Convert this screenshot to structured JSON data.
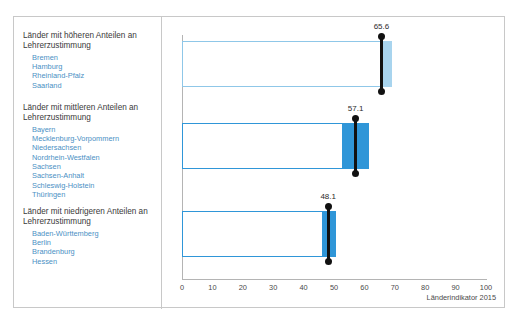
{
  "top_caption": "",
  "footer": {
    "source": "Länderindikator 2015"
  },
  "axis": {
    "ticks": [
      "0",
      "10",
      "20",
      "30",
      "40",
      "50",
      "60",
      "70",
      "80",
      "90",
      "100"
    ],
    "min": 0,
    "max": 100,
    "step": 10
  },
  "groups": [
    {
      "heading": "Länder mit höheren Anteilen an Lehrerzustimmung",
      "states": [
        "Bremen",
        "Hamburg",
        "Rheinland-Pfalz",
        "Saarland"
      ],
      "value_label": "65.6"
    },
    {
      "heading": "Länder mit mittleren Anteilen an Lehrerzustimmung",
      "states": [
        "Bayern",
        "Mecklenburg-Vorpommern",
        "Niedersachsen",
        "Nordrhein-Westfalen",
        "Sachsen",
        "Sachsen-Anhalt",
        "Schleswig-Holstein",
        "Thüringen"
      ],
      "value_label": "57.1"
    },
    {
      "heading": "Länder mit niedrigeren Anteilen an Lehrerzustimmung",
      "states": [
        "Baden-Württemberg",
        "Berlin",
        "Brandenburg",
        "Hessen"
      ],
      "value_label": "48.1"
    }
  ],
  "colors": {
    "light_blue_fill": "#a8d4ee",
    "light_blue_outline": "#8fc7e8",
    "strong_blue_fill": "#2f96d8",
    "strong_blue_outline": "#2f96d8",
    "marker": "#111111",
    "state_text": "#4a90c4",
    "heading_text": "#3a3a3a",
    "axis": "#b4b4b4"
  },
  "chart_data": {
    "type": "bar",
    "title": "",
    "subtitle": "",
    "xlabel": "",
    "ylabel": "",
    "xlim": [
      0,
      100
    ],
    "grid": false,
    "legend": "none",
    "orientation": "horizontal",
    "categories": [
      "Länder mit höheren Anteilen an Lehrerzustimmung",
      "Länder mit mittleren Anteilen an Lehrerzustimmung",
      "Länder mit niedrigeren Anteilen an Lehrerzustimmung"
    ],
    "values": [
      65.6,
      57.1,
      48.1
    ],
    "series": [
      {
        "name": "Lehrerzustimmung (%)",
        "values": [
          65.6,
          57.1,
          48.1
        ]
      }
    ],
    "bars": [
      {
        "category": "höhere Anteile",
        "marker_value": 65.6,
        "box_start": 0,
        "box_end": 65.6,
        "fill_start": 64.0,
        "fill_end": 69.0,
        "fill_color": "#a8d4ee",
        "annotation": "65.6"
      },
      {
        "category": "mittlere Anteile",
        "marker_value": 57.1,
        "box_start": 0,
        "box_end": 53.0,
        "fill_start": 53.0,
        "fill_end": 61.5,
        "fill_color": "#2f96d8",
        "annotation": "57.1"
      },
      {
        "category": "niedrigere Anteile",
        "marker_value": 48.1,
        "box_start": 0,
        "box_end": 46.5,
        "fill_start": 46.5,
        "fill_end": 50.5,
        "fill_color": "#2f96d8",
        "annotation": "48.1"
      }
    ],
    "annotations": [
      "65.6",
      "57.1",
      "48.1"
    ],
    "tick_labels": [
      "0",
      "10",
      "20",
      "30",
      "40",
      "50",
      "60",
      "70",
      "80",
      "90",
      "100"
    ],
    "source_note": "Länderindikator 2015"
  }
}
